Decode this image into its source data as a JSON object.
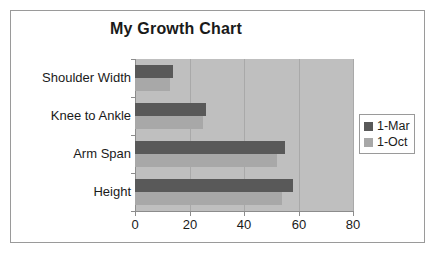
{
  "chart_data": {
    "type": "bar",
    "orientation": "horizontal",
    "title": "My Growth Chart",
    "xlabel": "",
    "ylabel": "",
    "categories": [
      "Height",
      "Arm Span",
      "Knee to Ankle",
      "Shoulder Width"
    ],
    "series": [
      {
        "name": "1-Mar",
        "color": "#595959",
        "values": [
          58,
          55,
          26,
          14
        ]
      },
      {
        "name": "1-Oct",
        "color": "#a8a8a8",
        "values": [
          54,
          52,
          25,
          13
        ]
      }
    ],
    "xlim": [
      0,
      80
    ],
    "xticks": [
      0,
      20,
      40,
      60,
      80
    ],
    "xtick_labels": [
      "0",
      "20",
      "40",
      "60",
      "80"
    ],
    "grid": true,
    "grid_axis": "x",
    "legend_position": "right",
    "plot_background": "#bfbfbf",
    "frame_background": "#ffffff",
    "border_color": "#9a9a9a"
  },
  "legend": {
    "entries": [
      {
        "label": "1-Mar",
        "color": "#595959"
      },
      {
        "label": "1-Oct",
        "color": "#a8a8a8"
      }
    ]
  }
}
